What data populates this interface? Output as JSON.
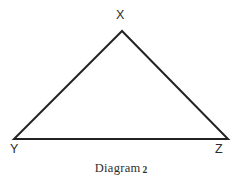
{
  "figure": {
    "name": "triangle-diagram",
    "background_color": "#ffffff",
    "stroke_color": "#232323",
    "stroke_width": 2,
    "caption": {
      "text": "Diagram",
      "number": "2"
    },
    "vertices": [
      {
        "label": "X",
        "x": 122,
        "y": 31,
        "position": "apex"
      },
      {
        "label": "Y",
        "x": 14,
        "y": 139,
        "position": "bottom-left"
      },
      {
        "label": "Z",
        "x": 228,
        "y": 139,
        "position": "bottom-right"
      }
    ],
    "edges": [
      {
        "name": "edge-xy",
        "from": "X",
        "to": "Y"
      },
      {
        "name": "edge-xz",
        "from": "X",
        "to": "Z"
      },
      {
        "name": "edge-yz",
        "from": "Y",
        "to": "Z"
      }
    ]
  }
}
